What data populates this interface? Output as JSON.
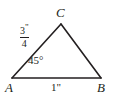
{
  "figure": {
    "type": "triangle-diagram",
    "background_color": "#ffffff",
    "stroke_color": "#231f20",
    "vertices": {
      "A": {
        "label": "A",
        "x": 12,
        "y": 78
      },
      "B": {
        "label": "B",
        "x": 101,
        "y": 78
      },
      "C": {
        "label": "C",
        "x": 61,
        "y": 24
      }
    },
    "labels": {
      "angle_at_A": "45°",
      "side_AB": "1\"",
      "side_AC_numerator": "3",
      "side_AC_inch_mark": "\"",
      "side_AC_denominator": "4"
    }
  }
}
